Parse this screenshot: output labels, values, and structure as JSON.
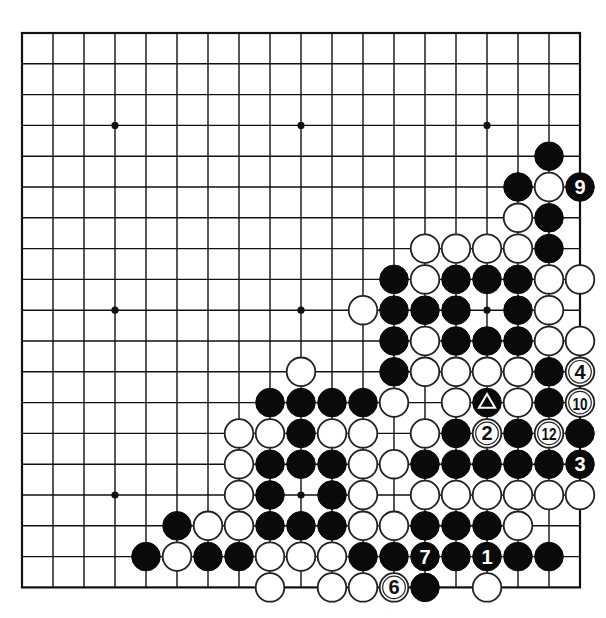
{
  "board": {
    "size": 19,
    "origin_x": 22,
    "origin_y": 33,
    "spacing_x": 31.0,
    "spacing_y": 30.8,
    "stone_radius": 14.3,
    "star_points": [
      [
        3,
        3
      ],
      [
        3,
        9
      ],
      [
        3,
        15
      ],
      [
        9,
        3
      ],
      [
        9,
        9
      ],
      [
        9,
        15
      ],
      [
        15,
        3
      ],
      [
        15,
        9
      ],
      [
        15,
        15
      ]
    ],
    "colors": {
      "black": "#0a0a0a",
      "white": "#ffffff",
      "line": "#111111"
    }
  },
  "stones": [
    {
      "row": 4,
      "col": 17,
      "color": "black"
    },
    {
      "row": 5,
      "col": 16,
      "color": "black"
    },
    {
      "row": 5,
      "col": 17,
      "color": "white"
    },
    {
      "row": 5,
      "col": 18,
      "color": "black",
      "label": "9"
    },
    {
      "row": 6,
      "col": 16,
      "color": "white"
    },
    {
      "row": 6,
      "col": 17,
      "color": "black"
    },
    {
      "row": 7,
      "col": 13,
      "color": "white"
    },
    {
      "row": 7,
      "col": 14,
      "color": "white"
    },
    {
      "row": 7,
      "col": 15,
      "color": "white"
    },
    {
      "row": 7,
      "col": 16,
      "color": "white"
    },
    {
      "row": 7,
      "col": 17,
      "color": "black"
    },
    {
      "row": 8,
      "col": 12,
      "color": "black"
    },
    {
      "row": 8,
      "col": 13,
      "color": "white"
    },
    {
      "row": 8,
      "col": 14,
      "color": "black"
    },
    {
      "row": 8,
      "col": 15,
      "color": "black"
    },
    {
      "row": 8,
      "col": 16,
      "color": "black"
    },
    {
      "row": 8,
      "col": 17,
      "color": "white"
    },
    {
      "row": 8,
      "col": 18,
      "color": "white"
    },
    {
      "row": 9,
      "col": 11,
      "color": "white"
    },
    {
      "row": 9,
      "col": 12,
      "color": "black"
    },
    {
      "row": 9,
      "col": 13,
      "color": "black"
    },
    {
      "row": 9,
      "col": 14,
      "color": "black"
    },
    {
      "row": 9,
      "col": 16,
      "color": "black"
    },
    {
      "row": 9,
      "col": 17,
      "color": "white"
    },
    {
      "row": 10,
      "col": 12,
      "color": "black"
    },
    {
      "row": 10,
      "col": 13,
      "color": "white"
    },
    {
      "row": 10,
      "col": 14,
      "color": "black"
    },
    {
      "row": 10,
      "col": 15,
      "color": "black"
    },
    {
      "row": 10,
      "col": 16,
      "color": "black"
    },
    {
      "row": 10,
      "col": 17,
      "color": "white"
    },
    {
      "row": 10,
      "col": 18,
      "color": "white"
    },
    {
      "row": 11,
      "col": 9,
      "color": "white"
    },
    {
      "row": 11,
      "col": 12,
      "color": "black"
    },
    {
      "row": 11,
      "col": 13,
      "color": "white"
    },
    {
      "row": 11,
      "col": 14,
      "color": "white"
    },
    {
      "row": 11,
      "col": 15,
      "color": "white"
    },
    {
      "row": 11,
      "col": 16,
      "color": "white"
    },
    {
      "row": 11,
      "col": 17,
      "color": "black"
    },
    {
      "row": 11,
      "col": 18,
      "color": "white",
      "label": "4"
    },
    {
      "row": 12,
      "col": 8,
      "color": "black"
    },
    {
      "row": 12,
      "col": 9,
      "color": "black"
    },
    {
      "row": 12,
      "col": 10,
      "color": "black"
    },
    {
      "row": 12,
      "col": 11,
      "color": "black"
    },
    {
      "row": 12,
      "col": 12,
      "color": "white"
    },
    {
      "row": 12,
      "col": 14,
      "color": "white"
    },
    {
      "row": 12,
      "col": 15,
      "color": "black",
      "label": "triangle"
    },
    {
      "row": 12,
      "col": 16,
      "color": "white"
    },
    {
      "row": 12,
      "col": 17,
      "color": "black"
    },
    {
      "row": 12,
      "col": 18,
      "color": "white",
      "label": "10"
    },
    {
      "row": 13,
      "col": 7,
      "color": "white"
    },
    {
      "row": 13,
      "col": 8,
      "color": "white"
    },
    {
      "row": 13,
      "col": 9,
      "color": "black"
    },
    {
      "row": 13,
      "col": 10,
      "color": "white"
    },
    {
      "row": 13,
      "col": 11,
      "color": "white"
    },
    {
      "row": 13,
      "col": 13,
      "color": "white"
    },
    {
      "row": 13,
      "col": 14,
      "color": "black"
    },
    {
      "row": 13,
      "col": 15,
      "color": "white",
      "label": "2"
    },
    {
      "row": 13,
      "col": 16,
      "color": "black"
    },
    {
      "row": 13,
      "col": 17,
      "color": "white",
      "label": "12"
    },
    {
      "row": 13,
      "col": 18,
      "color": "black"
    },
    {
      "row": 14,
      "col": 7,
      "color": "white"
    },
    {
      "row": 14,
      "col": 8,
      "color": "black"
    },
    {
      "row": 14,
      "col": 9,
      "color": "black"
    },
    {
      "row": 14,
      "col": 10,
      "color": "black"
    },
    {
      "row": 14,
      "col": 11,
      "color": "white"
    },
    {
      "row": 14,
      "col": 12,
      "color": "white"
    },
    {
      "row": 14,
      "col": 13,
      "color": "black"
    },
    {
      "row": 14,
      "col": 14,
      "color": "black"
    },
    {
      "row": 14,
      "col": 15,
      "color": "black"
    },
    {
      "row": 14,
      "col": 16,
      "color": "black"
    },
    {
      "row": 14,
      "col": 17,
      "color": "black"
    },
    {
      "row": 14,
      "col": 18,
      "color": "black",
      "label": "3"
    },
    {
      "row": 15,
      "col": 7,
      "color": "white"
    },
    {
      "row": 15,
      "col": 8,
      "color": "black"
    },
    {
      "row": 15,
      "col": 10,
      "color": "black"
    },
    {
      "row": 15,
      "col": 11,
      "color": "white"
    },
    {
      "row": 15,
      "col": 13,
      "color": "white"
    },
    {
      "row": 15,
      "col": 14,
      "color": "white"
    },
    {
      "row": 15,
      "col": 15,
      "color": "white"
    },
    {
      "row": 15,
      "col": 16,
      "color": "white"
    },
    {
      "row": 15,
      "col": 17,
      "color": "white"
    },
    {
      "row": 15,
      "col": 18,
      "color": "white"
    },
    {
      "row": 16,
      "col": 5,
      "color": "black"
    },
    {
      "row": 16,
      "col": 6,
      "color": "white"
    },
    {
      "row": 16,
      "col": 7,
      "color": "white"
    },
    {
      "row": 16,
      "col": 8,
      "color": "black"
    },
    {
      "row": 16,
      "col": 9,
      "color": "black"
    },
    {
      "row": 16,
      "col": 10,
      "color": "black"
    },
    {
      "row": 16,
      "col": 11,
      "color": "white"
    },
    {
      "row": 16,
      "col": 12,
      "color": "white"
    },
    {
      "row": 16,
      "col": 13,
      "color": "black"
    },
    {
      "row": 16,
      "col": 14,
      "color": "black"
    },
    {
      "row": 16,
      "col": 15,
      "color": "black"
    },
    {
      "row": 16,
      "col": 16,
      "color": "white"
    },
    {
      "row": 17,
      "col": 4,
      "color": "black"
    },
    {
      "row": 17,
      "col": 5,
      "color": "white"
    },
    {
      "row": 17,
      "col": 6,
      "color": "black"
    },
    {
      "row": 17,
      "col": 7,
      "color": "black"
    },
    {
      "row": 17,
      "col": 8,
      "color": "white"
    },
    {
      "row": 17,
      "col": 9,
      "color": "white"
    },
    {
      "row": 17,
      "col": 10,
      "color": "white"
    },
    {
      "row": 17,
      "col": 11,
      "color": "black"
    },
    {
      "row": 17,
      "col": 12,
      "color": "black"
    },
    {
      "row": 17,
      "col": 13,
      "color": "black",
      "label": "7"
    },
    {
      "row": 17,
      "col": 14,
      "color": "black"
    },
    {
      "row": 17,
      "col": 15,
      "color": "black",
      "label": "1"
    },
    {
      "row": 17,
      "col": 16,
      "color": "black"
    },
    {
      "row": 17,
      "col": 17,
      "color": "black"
    },
    {
      "row": 18,
      "col": 8,
      "color": "white"
    },
    {
      "row": 18,
      "col": 10,
      "color": "white"
    },
    {
      "row": 18,
      "col": 11,
      "color": "white"
    },
    {
      "row": 18,
      "col": 12,
      "color": "white",
      "label": "6"
    },
    {
      "row": 18,
      "col": 13,
      "color": "black"
    },
    {
      "row": 18,
      "col": 15,
      "color": "white"
    }
  ],
  "move_labels": [
    "1",
    "2",
    "3",
    "4",
    "6",
    "7",
    "9",
    "10",
    "12"
  ],
  "marker": {
    "type": "triangle",
    "row": 12,
    "col": 15,
    "color": "black"
  }
}
